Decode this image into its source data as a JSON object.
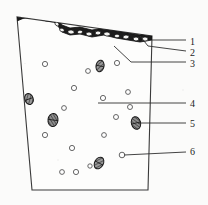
{
  "figure": {
    "kind": "cross-section-diagram",
    "style": "scanned-line-drawing",
    "background_color": "#fbfbfa",
    "line_color": "#2a2a2a",
    "surface_layer_color": "#1a1a1a",
    "aggregate_fill_color": "#6e6e6e",
    "void_stroke_color": "#555555"
  },
  "specimen": {
    "outline_points": "32,190 148,190 152,36 17,17",
    "left_edge": {
      "top": "17,17",
      "bottom": "32,190"
    },
    "right_edge": {
      "top": "152,36",
      "bottom": "148,190"
    },
    "bottom_edge": {
      "left": "32,190",
      "right": "148,190"
    }
  },
  "surface_layer": {
    "description": "dark irregular stippled crust along the top boundary with light pebble inclusions",
    "profile_points": "17,17 24,14 38,14 46,17 54,18 58,22 62,28 70,31 80,30 92,33 104,31 116,34 128,36 140,38 152,36",
    "inclusions": [
      {
        "cx": 24,
        "cy": 16,
        "rx": 3.0,
        "ry": 2.0,
        "rot": -8
      },
      {
        "cx": 32,
        "cy": 16,
        "rx": 3.4,
        "ry": 2.0,
        "rot": -4
      },
      {
        "cx": 40,
        "cy": 17,
        "rx": 2.6,
        "ry": 1.8,
        "rot": 0
      },
      {
        "cx": 57,
        "cy": 24,
        "rx": 2.2,
        "ry": 1.7,
        "rot": 40
      },
      {
        "cx": 62,
        "cy": 30,
        "rx": 2.4,
        "ry": 1.7,
        "rot": 20
      },
      {
        "cx": 71,
        "cy": 32,
        "rx": 3.2,
        "ry": 2.0,
        "rot": 6
      },
      {
        "cx": 80,
        "cy": 32,
        "rx": 2.6,
        "ry": 1.8,
        "rot": -6
      },
      {
        "cx": 89,
        "cy": 34,
        "rx": 3.0,
        "ry": 1.9,
        "rot": 4
      },
      {
        "cx": 98,
        "cy": 33,
        "rx": 2.8,
        "ry": 1.9,
        "rot": -3
      },
      {
        "cx": 107,
        "cy": 34,
        "rx": 3.2,
        "ry": 2.0,
        "rot": 5
      },
      {
        "cx": 117,
        "cy": 36,
        "rx": 2.6,
        "ry": 1.8,
        "rot": 0
      },
      {
        "cx": 126,
        "cy": 37,
        "rx": 3.0,
        "ry": 1.9,
        "rot": -5
      },
      {
        "cx": 136,
        "cy": 39,
        "rx": 2.8,
        "ry": 1.9,
        "rot": 3
      },
      {
        "cx": 145,
        "cy": 39,
        "rx": 3.0,
        "ry": 2.0,
        "rot": -2
      }
    ]
  },
  "voids": [
    {
      "cx": 45,
      "cy": 64,
      "r": 2.6
    },
    {
      "cx": 88,
      "cy": 71,
      "r": 2.4
    },
    {
      "cx": 117,
      "cy": 63,
      "r": 2.6
    },
    {
      "cx": 74,
      "cy": 88,
      "r": 2.6
    },
    {
      "cx": 128,
      "cy": 92,
      "r": 2.4
    },
    {
      "cx": 103,
      "cy": 98,
      "r": 2.6
    },
    {
      "cx": 64,
      "cy": 108,
      "r": 2.4
    },
    {
      "cx": 130,
      "cy": 107,
      "r": 2.5
    },
    {
      "cx": 116,
      "cy": 117,
      "r": 2.5
    },
    {
      "cx": 45,
      "cy": 135,
      "r": 2.6
    },
    {
      "cx": 104,
      "cy": 135,
      "r": 2.4
    },
    {
      "cx": 72,
      "cy": 148,
      "r": 2.6
    },
    {
      "cx": 122,
      "cy": 155,
      "r": 2.8
    },
    {
      "cx": 62,
      "cy": 172,
      "r": 2.4
    },
    {
      "cx": 76,
      "cy": 172,
      "r": 2.6
    },
    {
      "cx": 90,
      "cy": 166,
      "r": 2.2
    }
  ],
  "aggregates": [
    {
      "cx": 29,
      "cy": 99,
      "rx": 4.2,
      "ry": 5.6,
      "rot": -20
    },
    {
      "cx": 53,
      "cy": 120,
      "rx": 5.0,
      "ry": 6.6,
      "rot": 8
    },
    {
      "cx": 100,
      "cy": 66,
      "rx": 4.0,
      "ry": 5.8,
      "rot": 12
    },
    {
      "cx": 136,
      "cy": 123,
      "rx": 4.6,
      "ry": 6.4,
      "rot": -14
    },
    {
      "cx": 99,
      "cy": 163,
      "rx": 4.4,
      "ry": 6.2,
      "rot": 28
    }
  ],
  "callouts": [
    {
      "id": "1",
      "label": "1",
      "text_x": 190,
      "text_y": 43,
      "leader": "152,40 186,40",
      "target": "152,40",
      "points_to": "surface-layer-top"
    },
    {
      "id": "2",
      "label": "2",
      "text_x": 190,
      "text_y": 54,
      "leader": "140,36 148,46 186,51",
      "target": "140,36",
      "points_to": "surface-layer-inclusion"
    },
    {
      "id": "3",
      "label": "3",
      "text_x": 190,
      "text_y": 65,
      "leader": "114,46 131,62 186,62",
      "target": "114,46",
      "points_to": "subsurface-particle"
    },
    {
      "id": "4",
      "label": "4",
      "text_x": 190,
      "text_y": 105,
      "leader": "98,103 186,103",
      "target": "98,103",
      "points_to": "matrix"
    },
    {
      "id": "5",
      "label": "5",
      "text_x": 190,
      "text_y": 125,
      "leader": "138,123 186,123",
      "target": "138,123",
      "points_to": "aggregate-particle"
    },
    {
      "id": "6",
      "label": "6",
      "text_x": 190,
      "text_y": 153,
      "leader": "124,155 186,152",
      "target": "124,155",
      "points_to": "void"
    }
  ]
}
